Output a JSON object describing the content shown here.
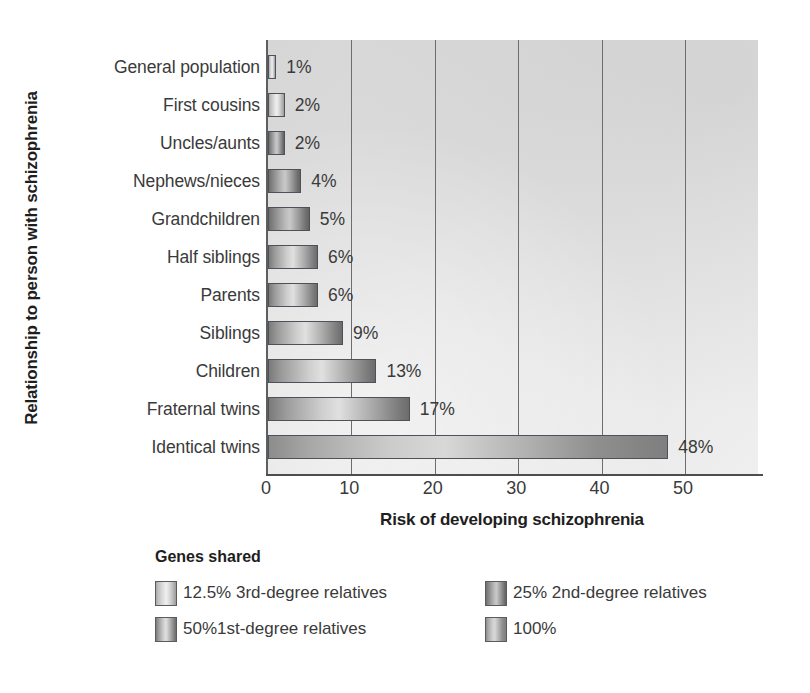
{
  "chart_data": {
    "type": "bar",
    "orientation": "horizontal",
    "title": "",
    "xlabel": "Risk of developing schizophrenia",
    "ylabel": "Relationship to person with schizophrenia",
    "xlim": [
      0,
      59
    ],
    "xticks": [
      0,
      10,
      20,
      30,
      40,
      50
    ],
    "grid": "vertical",
    "categories": [
      "General population",
      "First cousins",
      "Uncles/aunts",
      "Nephews/nieces",
      "Grandchildren",
      "Half siblings",
      "Parents",
      "Siblings",
      "Children",
      "Fraternal twins",
      "Identical twins"
    ],
    "values": [
      1,
      2,
      2,
      4,
      5,
      6,
      6,
      9,
      13,
      17,
      48
    ],
    "value_labels": [
      "1%",
      "2%",
      "2%",
      "4%",
      "5%",
      "6%",
      "6%",
      "9%",
      "13%",
      "17%",
      "48%"
    ],
    "group_by_category": [
      "12.5",
      "12.5",
      "25",
      "25",
      "25",
      "50",
      "50",
      "50",
      "50",
      "50",
      "100"
    ],
    "legend": {
      "title": "Genes shared",
      "position": "below-left",
      "entries": [
        {
          "key": "12.5",
          "label": "12.5% 3rd-degree relatives"
        },
        {
          "key": "25",
          "label": "25% 2nd-degree relatives"
        },
        {
          "key": "50",
          "label": "50%1st-degree relatives"
        },
        {
          "key": "100",
          "label": "100%"
        }
      ]
    },
    "colors": {
      "plot_background": "#dcdcdc",
      "gridline": "#6d6d6d",
      "axis": "#4d4d4d",
      "text": "#3a3a3a",
      "swatch_12_5": "#d8d8d8",
      "swatch_25": "#9a9a9a",
      "swatch_50": "#b0b0b0",
      "swatch_100": "#bcbcbc"
    }
  }
}
